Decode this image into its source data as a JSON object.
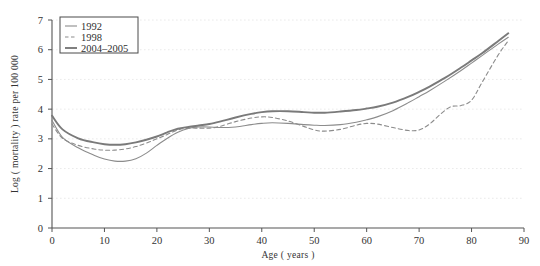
{
  "chart_data": {
    "type": "line",
    "title": "",
    "xlabel": "Age ( years )",
    "ylabel": "Log ( mortality ) rate per 100 000",
    "xlim": [
      0,
      90
    ],
    "ylim": [
      0,
      7
    ],
    "xticks": [
      0,
      10,
      20,
      30,
      40,
      50,
      60,
      70,
      80,
      90
    ],
    "yticks": [
      0,
      1,
      2,
      3,
      4,
      5,
      6,
      7
    ],
    "grid": true,
    "grid_style": "dotted-horizontal",
    "legend_position": "top-left",
    "series": [
      {
        "name": "1992",
        "color": "#8c8c8c",
        "dash": "solid",
        "width": 1.1,
        "x": [
          0,
          2,
          5,
          8,
          10,
          12,
          14,
          16,
          18,
          20,
          22,
          24,
          26,
          28,
          30,
          32,
          35,
          38,
          40,
          42,
          45,
          48,
          50,
          52,
          55,
          58,
          60,
          62,
          65,
          68,
          70,
          72,
          75,
          78,
          80,
          82,
          85,
          87
        ],
        "y": [
          3.62,
          3.05,
          2.7,
          2.45,
          2.32,
          2.25,
          2.25,
          2.33,
          2.52,
          2.78,
          3.02,
          3.22,
          3.35,
          3.4,
          3.4,
          3.38,
          3.4,
          3.48,
          3.52,
          3.54,
          3.52,
          3.48,
          3.46,
          3.45,
          3.48,
          3.56,
          3.64,
          3.74,
          3.95,
          4.22,
          4.42,
          4.62,
          4.95,
          5.3,
          5.55,
          5.8,
          6.18,
          6.42
        ]
      },
      {
        "name": "1998",
        "color": "#8c8c8c",
        "dash": "dashed",
        "width": 1.1,
        "x": [
          0,
          2,
          5,
          8,
          10,
          12,
          14,
          16,
          18,
          20,
          22,
          24,
          26,
          28,
          30,
          32,
          35,
          38,
          40,
          42,
          45,
          48,
          50,
          52,
          55,
          58,
          60,
          62,
          65,
          68,
          70,
          72,
          74,
          76,
          78,
          80,
          82,
          85,
          87
        ],
        "y": [
          3.5,
          3.02,
          2.78,
          2.66,
          2.62,
          2.62,
          2.66,
          2.74,
          2.86,
          3.0,
          3.15,
          3.3,
          3.36,
          3.36,
          3.36,
          3.42,
          3.58,
          3.7,
          3.74,
          3.72,
          3.6,
          3.42,
          3.3,
          3.26,
          3.32,
          3.46,
          3.52,
          3.5,
          3.38,
          3.28,
          3.3,
          3.5,
          3.82,
          4.08,
          4.12,
          4.3,
          4.9,
          5.8,
          6.3
        ]
      },
      {
        "name": "2004–2005",
        "color": "#7a7a7a",
        "dash": "solid",
        "width": 1.9,
        "x": [
          0,
          2,
          5,
          8,
          10,
          12,
          14,
          16,
          18,
          20,
          22,
          24,
          26,
          28,
          30,
          32,
          35,
          38,
          40,
          42,
          45,
          48,
          50,
          52,
          55,
          58,
          60,
          62,
          65,
          68,
          70,
          72,
          75,
          78,
          80,
          82,
          85,
          87
        ],
        "y": [
          3.78,
          3.32,
          3.02,
          2.88,
          2.82,
          2.8,
          2.82,
          2.88,
          2.97,
          3.08,
          3.22,
          3.34,
          3.4,
          3.45,
          3.5,
          3.58,
          3.72,
          3.84,
          3.9,
          3.93,
          3.93,
          3.9,
          3.88,
          3.88,
          3.92,
          3.97,
          4.02,
          4.08,
          4.22,
          4.42,
          4.58,
          4.76,
          5.06,
          5.4,
          5.64,
          5.88,
          6.28,
          6.55
        ]
      }
    ]
  },
  "legend": {
    "items": [
      {
        "label": "1992",
        "swatch": "solid-line-swatch"
      },
      {
        "label": "1998",
        "swatch": "dashed-line-swatch"
      },
      {
        "label": "2004–2005",
        "swatch": "thick-line-swatch"
      }
    ]
  },
  "axes": {
    "x_tick_labels": [
      "0",
      "10",
      "20",
      "30",
      "40",
      "50",
      "60",
      "70",
      "80",
      "90"
    ],
    "y_tick_labels": [
      "0",
      "1",
      "2",
      "3",
      "4",
      "5",
      "6",
      "7"
    ],
    "x_title": "Age ( years )",
    "y_title": "Log ( mortality ) rate per 100 000"
  },
  "colors": {
    "axis": "#555555",
    "grid": "#e4e4e4",
    "series_1992": "#8c8c8c",
    "series_1998": "#8c8c8c",
    "series_2004": "#7a7a7a",
    "background": "#ffffff"
  }
}
